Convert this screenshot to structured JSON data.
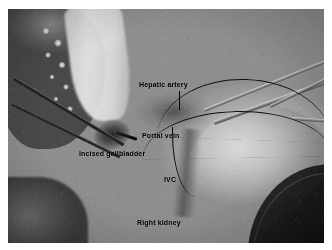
{
  "figure": {
    "type": "intraoperative-photograph",
    "modality": "open abdominal surgery / hepatobiliary field",
    "color_mode": "grayscale",
    "background_color": "#ffffff",
    "label_color": "#000000",
    "photo": {
      "x": 8,
      "y": 9,
      "width": 316,
      "height": 234
    }
  },
  "annotations": [
    {
      "id": "hepatic-artery",
      "label": "Hepatic artery",
      "has_leader_line": "yes",
      "leader_direction": "down"
    },
    {
      "id": "portal-vein",
      "label": "Portal vein",
      "has_leader_line": "no",
      "leader_direction": ""
    },
    {
      "id": "incised-gallbladder",
      "label": "Incised gallbladder",
      "has_leader_line": "no",
      "leader_direction": ""
    },
    {
      "id": "ivc",
      "label": "IVC",
      "has_leader_line": "no",
      "leader_direction": ""
    },
    {
      "id": "right-kidney",
      "label": "Right kidney",
      "has_leader_line": "no",
      "leader_direction": ""
    }
  ],
  "scene": {
    "instruments": [
      "forceps-upper-left",
      "forceps-lower-left",
      "forceps-tip",
      "retractor-shaft-right-upper",
      "retractor-shaft-right-lower",
      "suction-shaft-right",
      "clamp-right-edge"
    ],
    "sutures": [
      "suture-arc-upper",
      "suture-arc-middle",
      "suture-vertical-ivc"
    ],
    "structures": [
      "dark-tissue-mass-upper-left",
      "nodular-highlights",
      "pale-retracted-tissue-column",
      "right-kidney-bulge",
      "dark-drape-lower-right",
      "dark-band-lower-left",
      "gallbladder-opening",
      "porta-hepatis-shadow",
      "ivc-groove",
      "vessel-striations"
    ]
  }
}
